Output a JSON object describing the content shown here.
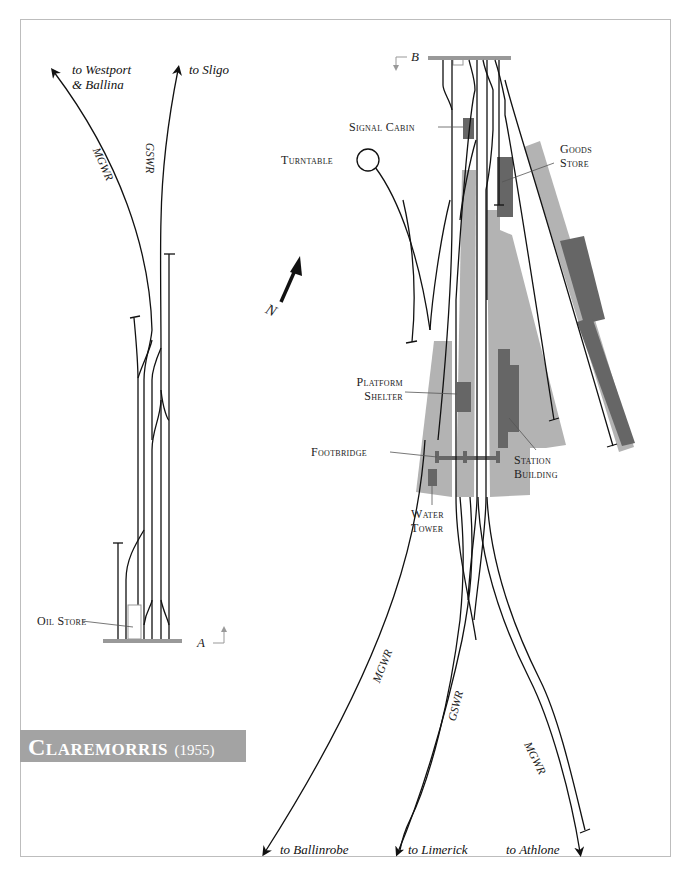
{
  "title": {
    "name": "Claremorris",
    "year": "(1955)"
  },
  "colors": {
    "track": "#111111",
    "platform": "#b3b3b3",
    "building": "#666666",
    "section_bar": "#999999",
    "title_bg": "#a3a3a3"
  },
  "destinations": {
    "westport": [
      "to Westport",
      "& Ballina"
    ],
    "sligo": "to Sligo",
    "ballinrobe": "to Ballinrobe",
    "limerick": "to Limerick",
    "athlone": "to Athlone"
  },
  "railways": {
    "mgwr_north": "MGWR",
    "gswr_north": "GSWR",
    "mgwr_south_west": "MGWR",
    "gswr_south": "GSWR",
    "mgwr_south_east": "MGWR"
  },
  "labels": {
    "signal_cabin": "Signal Cabin",
    "goods_store": [
      "Goods",
      "Store"
    ],
    "turntable": "Turntable",
    "platform_shelter": [
      "Platform",
      "Shelter"
    ],
    "footbridge": "Footbridge",
    "station_building": [
      "Station",
      "Building"
    ],
    "water_tower": [
      "Water",
      "Tower"
    ],
    "oil_store": "Oil Store"
  },
  "section_markers": {
    "a": "A",
    "b": "B"
  },
  "north_arrow": "N"
}
